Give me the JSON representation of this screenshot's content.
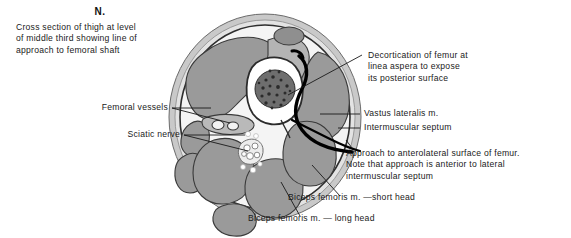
{
  "figure": {
    "heading": "N.",
    "caption_lines": [
      "Cross section of thigh at level",
      "of middle third showing line of",
      "approach to femoral shaft"
    ]
  },
  "labels": {
    "decortication": {
      "lines": [
        "Decortication of femur at",
        "linea aspera to expose",
        "its posterior surface"
      ]
    },
    "vastus_lateralis": {
      "text": "Vastus lateralis m."
    },
    "intermuscular_septum": {
      "text": "Intermuscular septum"
    },
    "approach_note": {
      "lines": [
        "Approach to anterolateral surface of femur.",
        "Note that approach is anterior to lateral",
        "intermuscular septum"
      ]
    },
    "femoral_vessels": {
      "text": "Femoral vessels"
    },
    "sciatic_nerve": {
      "text": "Sciatic nerve"
    },
    "biceps_short_head": {
      "text": "Biceps femoris m. —short head"
    },
    "biceps_long_head": {
      "text": "Biceps femoris m. — long head"
    }
  },
  "colors": {
    "background": "#ffffff",
    "ink": "#1a1a1a",
    "skin_outer": "#c9c9c9",
    "fascia": "#efefef",
    "muscle_fill": "#9a9a9a",
    "muscle_stroke": "#3a3a3a",
    "bone_cortex": "#ffffff",
    "marrow": "#5a5a5a",
    "approach_line": "#000000"
  },
  "illustration": {
    "type": "anatomical-cross-section",
    "region": "thigh, middle third",
    "structures": [
      "femur",
      "vastus lateralis m.",
      "lateral intermuscular septum",
      "femoral vessels",
      "sciatic nerve",
      "biceps femoris m. short head",
      "biceps femoris m. long head"
    ]
  }
}
